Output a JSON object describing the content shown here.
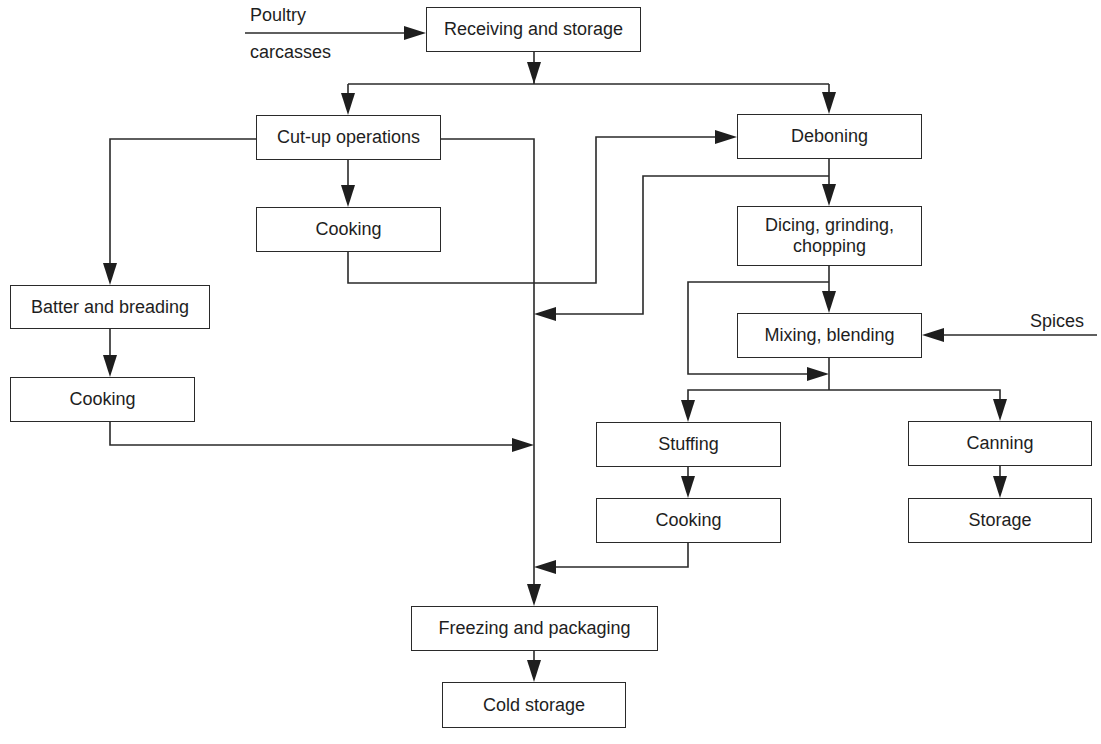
{
  "diagram": {
    "title": "",
    "type": "process-flowchart",
    "colors": {
      "line": "#2a2a2a",
      "text": "#1e1e1e",
      "background": "#ffffff"
    },
    "inputs": [
      {
        "id": "poultry",
        "text_line1": "Poultry",
        "text_line2": "carcasses"
      },
      {
        "id": "spices",
        "text": "Spices"
      }
    ],
    "nodes": {
      "receiving": {
        "label": "Receiving and storage"
      },
      "cutup": {
        "label": "Cut-up operations"
      },
      "cooking_cutup": {
        "label": "Cooking"
      },
      "batter": {
        "label": "Batter and breading"
      },
      "cooking_batter": {
        "label": "Cooking"
      },
      "deboning": {
        "label": "Deboning"
      },
      "dicing": {
        "label": "Dicing, grinding,\nchopping"
      },
      "mixing": {
        "label": "Mixing, blending"
      },
      "stuffing": {
        "label": "Stuffing"
      },
      "cooking_stuffing": {
        "label": "Cooking"
      },
      "canning": {
        "label": "Canning"
      },
      "storage": {
        "label": "Storage"
      },
      "freezing": {
        "label": "Freezing and packaging"
      },
      "cold_storage": {
        "label": "Cold storage"
      }
    },
    "edges": [
      {
        "from": "poultry",
        "to": "receiving"
      },
      {
        "from": "receiving",
        "to": "cutup"
      },
      {
        "from": "receiving",
        "to": "deboning"
      },
      {
        "from": "cutup",
        "to": "batter"
      },
      {
        "from": "cutup",
        "to": "cooking_cutup"
      },
      {
        "from": "cutup",
        "to": "freezing"
      },
      {
        "from": "cooking_cutup",
        "to": "deboning"
      },
      {
        "from": "deboning",
        "to": "freezing"
      },
      {
        "from": "deboning",
        "to": "dicing"
      },
      {
        "from": "batter",
        "to": "cooking_batter"
      },
      {
        "from": "cooking_batter",
        "to": "freezing"
      },
      {
        "from": "dicing",
        "to": "mixing"
      },
      {
        "from": "dicing",
        "to": "stuffing_canning_split"
      },
      {
        "from": "spices",
        "to": "mixing"
      },
      {
        "from": "mixing",
        "to": "stuffing"
      },
      {
        "from": "mixing",
        "to": "canning"
      },
      {
        "from": "stuffing",
        "to": "cooking_stuffing"
      },
      {
        "from": "cooking_stuffing",
        "to": "freezing"
      },
      {
        "from": "canning",
        "to": "storage"
      },
      {
        "from": "freezing",
        "to": "cold_storage"
      }
    ]
  }
}
